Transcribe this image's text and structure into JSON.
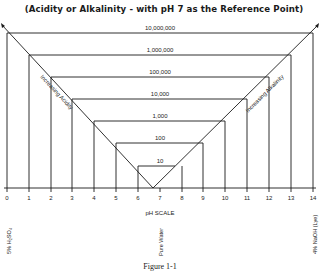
{
  "title": "(Acidity or Alkalinity - with pH 7 as the Reference Point)",
  "levels": [
    "10,000,000",
    "1,000,000",
    "100,000",
    "10,000",
    "1,000",
    "100",
    "10"
  ],
  "ph_ticks": [
    "0",
    "1",
    "2",
    "3",
    "4",
    "5",
    "6",
    "7",
    "8",
    "9",
    "10",
    "11",
    "12",
    "13",
    "14"
  ],
  "scale_label": "pH SCALE",
  "diagonal_labels": {
    "left": "Increasing Acidity",
    "right": "Increasing Alkalinity"
  },
  "reference_labels": {
    "acid": "5% H₂SO₄",
    "neutral": "Pure Water",
    "base": "4% NaOH (Lye)"
  },
  "caption": "Figure 1-1",
  "colors": {
    "line": "#1a1a1a",
    "background": "#ffffff"
  }
}
